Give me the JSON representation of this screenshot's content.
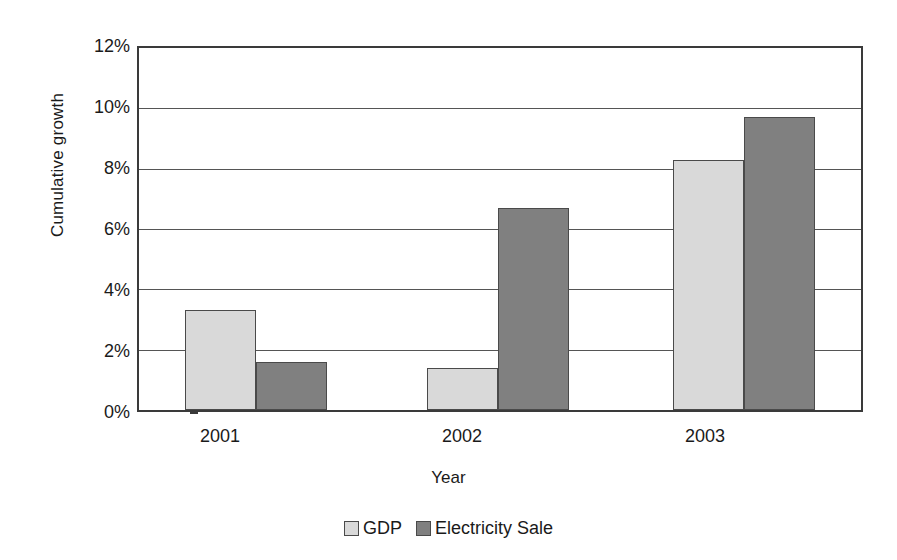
{
  "chart_data": {
    "type": "bar",
    "title": "",
    "xlabel": "Year",
    "ylabel": "Cumulative growth",
    "categories": [
      "2001",
      "2002",
      "2003"
    ],
    "series": [
      {
        "name": "GDP",
        "color": "#d9d9d9",
        "values": [
          3.3,
          1.4,
          8.3
        ]
      },
      {
        "name": "Electricity Sale",
        "color": "#808080",
        "values": [
          1.6,
          6.7,
          9.7
        ]
      }
    ],
    "ylim": [
      0,
      12
    ],
    "ytick_values": [
      0,
      2,
      4,
      6,
      8,
      10,
      12
    ],
    "ytick_labels": [
      "0%",
      "2%",
      "4%",
      "6%",
      "8%",
      "10%",
      "12%"
    ],
    "value_unit": "%",
    "grid": true,
    "legend_position": "bottom-center"
  },
  "axes": {
    "y_title": "Cumulative growth",
    "x_title": "Year",
    "y_ticks": [
      {
        "label": "12%",
        "value": 12
      },
      {
        "label": "10%",
        "value": 10
      },
      {
        "label": "8%",
        "value": 8
      },
      {
        "label": "6%",
        "value": 6
      },
      {
        "label": "4%",
        "value": 4
      },
      {
        "label": "2%",
        "value": 2
      },
      {
        "label": "0%",
        "value": 0
      }
    ],
    "x_ticks": [
      {
        "label": "2001"
      },
      {
        "label": "2002"
      },
      {
        "label": "2003"
      }
    ]
  },
  "legend": {
    "entries": [
      {
        "label": "GDP",
        "color": "#d9d9d9"
      },
      {
        "label": "Electricity Sale",
        "color": "#808080"
      }
    ]
  },
  "bars": [
    {
      "group": "2001",
      "series": "GDP",
      "value": 3.3
    },
    {
      "group": "2001",
      "series": "Electricity Sale",
      "value": 1.6
    },
    {
      "group": "2002",
      "series": "GDP",
      "value": 1.4
    },
    {
      "group": "2002",
      "series": "Electricity Sale",
      "value": 6.7
    },
    {
      "group": "2003",
      "series": "GDP",
      "value": 8.3
    },
    {
      "group": "2003",
      "series": "Electricity Sale",
      "value": 9.7
    }
  ]
}
